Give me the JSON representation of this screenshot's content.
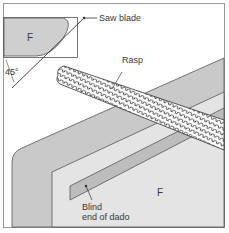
{
  "diagram": {
    "type": "woodworking-illustration",
    "colors": {
      "background": "#ffffff",
      "frame": "#9a9a9a",
      "panel_back": "#c9c9c9",
      "panel_front": "#e4e4e4",
      "dado": "#bdbdbd",
      "inset_fill": "#cfcfcf",
      "line": "#444444"
    },
    "inset": {
      "face_label": "F",
      "angle_label": "45°",
      "saw_label": "Saw blade"
    },
    "main": {
      "tool_label": "Rasp",
      "face_label": "F",
      "dado_label_line1": "Blind",
      "dado_label_line2": "end of dado"
    }
  }
}
